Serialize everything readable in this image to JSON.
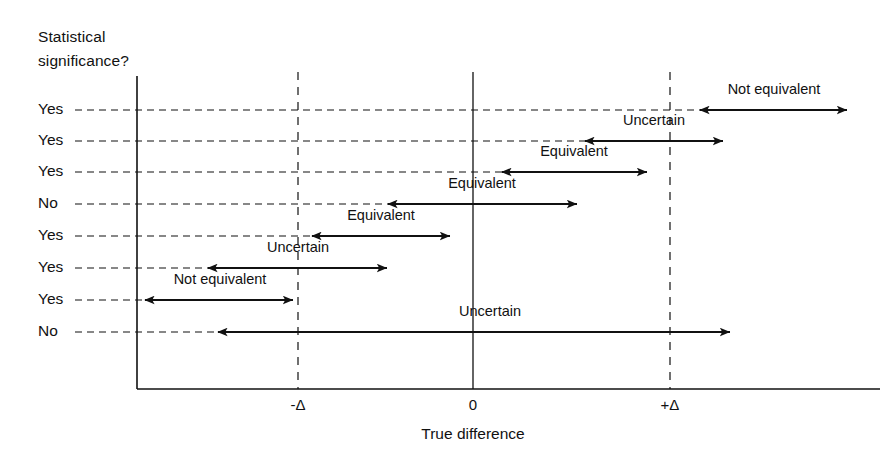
{
  "figure": {
    "header": {
      "line1": "Statistical",
      "line2": "significance?"
    },
    "axis": {
      "x_title": "True difference",
      "ticks": [
        {
          "label": "-Δ",
          "x": 298
        },
        {
          "label": "0",
          "x": 473
        },
        {
          "label": "+Δ",
          "x": 670
        }
      ]
    }
  },
  "chart_data": {
    "type": "range-interval",
    "title": "",
    "xlabel": "True difference",
    "ylabel": "Statistical significance?",
    "grid": true,
    "legend_position": "none",
    "x_reference_lines": [
      {
        "name": "lower-equivalence-bound",
        "label": "-Δ",
        "value": -1,
        "style": "dashed"
      },
      {
        "name": "null-value",
        "label": "0",
        "value": 0,
        "style": "solid"
      },
      {
        "name": "upper-equivalence-bound",
        "label": "+Δ",
        "value": 1,
        "style": "dashed"
      }
    ],
    "x_axis_pixel_map": {
      "minus_delta": 298,
      "zero": 473,
      "plus_delta": 670
    },
    "categories": [
      "Yes",
      "Yes",
      "Yes",
      "No",
      "Yes",
      "Yes",
      "Yes",
      "No"
    ],
    "rows": [
      {
        "index": 1,
        "significance": "Yes",
        "conclusion": "Not equivalent",
        "ci_low": 1.15,
        "ci_high": 1.9,
        "px_y": 110,
        "px_left": 700,
        "px_right": 847,
        "label_px_x": 774,
        "label_px_y": 91
      },
      {
        "index": 2,
        "significance": "Yes",
        "conclusion": "Uncertain",
        "ci_low": 0.57,
        "ci_high": 1.27,
        "px_y": 141,
        "px_left": 585,
        "px_right": 723,
        "label_px_x": 654,
        "label_px_y": 122
      },
      {
        "index": 3,
        "significance": "Yes",
        "conclusion": "Equivalent",
        "ci_low": 0.15,
        "ci_high": 0.88,
        "px_y": 172,
        "px_left": 502,
        "px_right": 647,
        "label_px_x": 574,
        "label_px_y": 153
      },
      {
        "index": 4,
        "significance": "No",
        "conclusion": "Equivalent",
        "ci_low": -0.43,
        "ci_high": 0.53,
        "px_y": 204,
        "px_left": 388,
        "px_right": 577,
        "label_px_x": 482,
        "label_px_y": 185
      },
      {
        "index": 5,
        "significance": "Yes",
        "conclusion": "Equivalent",
        "ci_low": -0.82,
        "ci_high": -0.13,
        "px_y": 236,
        "px_left": 312,
        "px_right": 450,
        "label_px_x": 381,
        "label_px_y": 217
      },
      {
        "index": 6,
        "significance": "Yes",
        "conclusion": "Uncertain",
        "ci_low": -1.33,
        "ci_high": -0.47,
        "px_y": 268,
        "px_left": 208,
        "px_right": 387,
        "label_px_x": 298,
        "label_px_y": 249
      },
      {
        "index": 7,
        "significance": "Yes",
        "conclusion": "Not equivalent",
        "ci_low": -1.7,
        "ci_high": -1.02,
        "px_y": 300,
        "px_left": 145,
        "px_right": 293,
        "label_px_x": 220,
        "label_px_y": 281
      },
      {
        "index": 8,
        "significance": "No",
        "conclusion": "Uncertain",
        "ci_low": -1.44,
        "ci_high": 1.42,
        "px_y": 332,
        "px_left": 218,
        "px_right": 730,
        "label_px_x": 490,
        "label_px_y": 313
      }
    ]
  }
}
